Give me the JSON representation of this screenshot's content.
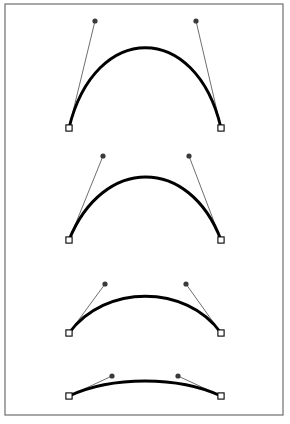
{
  "figure": {
    "width": 290,
    "height": 424,
    "background_color": "#ffffff",
    "frame": {
      "name": "outer-border",
      "x": 5,
      "y": 4,
      "width": 278,
      "height": 411,
      "stroke_color": "#6e6e6e",
      "stroke_width": 1.2
    },
    "styles": {
      "curve_color": "#000000",
      "curve_width": 2.9,
      "handle_color": "#4a4a4a",
      "handle_width": 0.8,
      "control_dot_color": "#3a3a3a",
      "control_dot_radius": 2.6,
      "endpoint_fill": "#ffffff",
      "endpoint_stroke": "#000000",
      "endpoint_size": 6.2,
      "endpoint_stroke_width": 1.1
    }
  },
  "chart_data": {
    "type": "line",
    "xlabel": "",
    "ylabel": "",
    "xlim": [
      5,
      283
    ],
    "ylim": [
      4,
      415
    ],
    "grid": false,
    "legend": "none",
    "annotations": [
      "Each curve is a cubic Bezier defined by two anchor squares and two control-point dots",
      "Control point height decreases from curve 1 (tallest) to curve 4 (flattest)"
    ],
    "series": [
      {
        "name": "curve-1",
        "index": 1,
        "start_point": {
          "x": 69,
          "y": 128
        },
        "end_point": {
          "x": 221,
          "y": 128
        },
        "control_point_1": {
          "x": 95,
          "y": 21
        },
        "control_point_2": {
          "x": 196,
          "y": 21
        },
        "apex": {
          "x": 145,
          "y": 44
        },
        "handle_length": 110,
        "path": "M 69 128 C 95 21 196 21 221 128"
      },
      {
        "name": "curve-2",
        "index": 2,
        "start_point": {
          "x": 69,
          "y": 240
        },
        "end_point": {
          "x": 221,
          "y": 240
        },
        "control_point_1": {
          "x": 103,
          "y": 156
        },
        "control_point_2": {
          "x": 189,
          "y": 156
        },
        "apex": {
          "x": 145,
          "y": 182
        },
        "handle_length": 90,
        "path": "M 69 240 C 103 156 189 156 221 240"
      },
      {
        "name": "curve-3",
        "index": 3,
        "start_point": {
          "x": 69,
          "y": 333
        },
        "end_point": {
          "x": 221,
          "y": 333
        },
        "control_point_1": {
          "x": 105,
          "y": 284
        },
        "control_point_2": {
          "x": 186,
          "y": 284
        },
        "apex": {
          "x": 145,
          "y": 297
        },
        "handle_length": 61,
        "path": "M 69 333 C 105 284 186 284 221 333"
      },
      {
        "name": "curve-4",
        "index": 4,
        "start_point": {
          "x": 69,
          "y": 396
        },
        "end_point": {
          "x": 221,
          "y": 396
        },
        "control_point_1": {
          "x": 112,
          "y": 376
        },
        "control_point_2": {
          "x": 178,
          "y": 376
        },
        "apex": {
          "x": 145,
          "y": 384
        },
        "handle_length": 47,
        "path": "M 69 396 C 112 376 178 376 221 396"
      }
    ]
  }
}
